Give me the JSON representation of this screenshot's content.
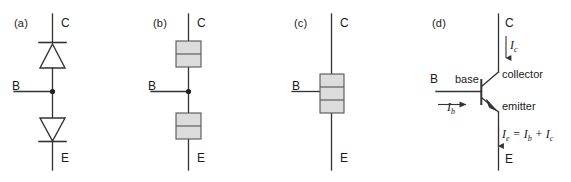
{
  "figure": {
    "background": "#ffffff",
    "line_color": "#333333",
    "box_fill": "#dcdcdc",
    "box_stroke": "#555555",
    "text_color": "#1a1a1a"
  },
  "panels": [
    {
      "id": "a",
      "label": "(a)",
      "description": "two-diode model",
      "terminals": {
        "collector": "C",
        "base": "B",
        "emitter": "E"
      }
    },
    {
      "id": "b",
      "label": "(b)",
      "description": "two separate np and pn junction blocks",
      "terminals": {
        "collector": "C",
        "base": "B",
        "emitter": "E"
      },
      "upper_block": {
        "top": "n",
        "bottom": "p"
      },
      "lower_block": {
        "top": "p",
        "bottom": "n"
      }
    },
    {
      "id": "c",
      "label": "(c)",
      "description": "merged npn sandwich",
      "terminals": {
        "collector": "C",
        "base": "B",
        "emitter": "E"
      },
      "layers": [
        "n",
        "p",
        "n"
      ]
    },
    {
      "id": "d",
      "label": "(d)",
      "description": "npn transistor circuit symbol with currents",
      "terminals": {
        "collector": "C",
        "base": "B",
        "emitter": "E"
      },
      "region_labels": {
        "base": "base",
        "collector": "collector",
        "emitter": "emitter"
      },
      "currents": {
        "collector": {
          "symbol": "I",
          "subscript": "c"
        },
        "base": {
          "symbol": "I",
          "subscript": "b"
        },
        "emitter_equation": {
          "lhs": {
            "symbol": "I",
            "subscript": "e"
          },
          "equals": "=",
          "term1": {
            "symbol": "I",
            "subscript": "b"
          },
          "plus": "+",
          "term2": {
            "symbol": "I",
            "subscript": "c"
          }
        }
      }
    }
  ]
}
